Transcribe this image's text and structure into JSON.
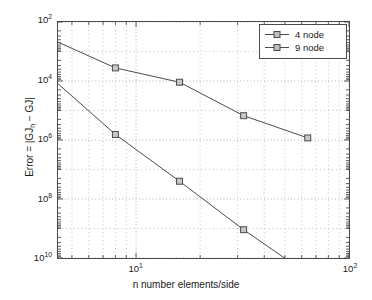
{
  "chart_data": {
    "type": "line",
    "title": "",
    "xlabel": "n number elements/side",
    "ylabel": "Error = |GJ_h − GJ|",
    "ylabel_parts": {
      "prefix": "Error = |GJ",
      "sub": "h",
      "suffix": " − GJ|"
    },
    "xscale": "log",
    "yscale": "log",
    "y_reversed": true,
    "xlim": [
      4.3,
      100
    ],
    "ylim": [
      100,
      10000000000
    ],
    "grid": true,
    "grid_style": "dotted",
    "legend_position": "upper right",
    "x": [
      4,
      8,
      16,
      32,
      64
    ],
    "xticks": [
      {
        "value": 10,
        "label_mantissa": "10",
        "label_exponent": "1"
      },
      {
        "value": 100,
        "label_mantissa": "10",
        "label_exponent": "2"
      }
    ],
    "yticks": [
      {
        "value": 100,
        "label_mantissa": "10",
        "label_exponent": "2"
      },
      {
        "value": 10000,
        "label_mantissa": "10",
        "label_exponent": "4"
      },
      {
        "value": 1000000,
        "label_mantissa": "10",
        "label_exponent": "6"
      },
      {
        "value": 100000000,
        "label_mantissa": "10",
        "label_exponent": "8"
      },
      {
        "value": 10000000000,
        "label_mantissa": "10",
        "label_exponent": "10"
      }
    ],
    "series": [
      {
        "name": "4 node",
        "marker": "square",
        "color": "#4a4a4a",
        "values": [
          380,
          3600,
          11000,
          150000,
          850000
        ]
      },
      {
        "name": "9 node",
        "marker": "square",
        "color": "#4a4a4a",
        "values": [
          7800,
          650000,
          25000000,
          1100000000,
          35000000000
        ]
      }
    ]
  },
  "legend": {
    "entries": [
      {
        "label": "4 node"
      },
      {
        "label": "9 node"
      }
    ]
  },
  "axes": {
    "x_title": "n number elements/side",
    "y_title_prefix": "Error = |GJ",
    "y_title_sub": "h",
    "y_title_suffix": " − GJ|"
  }
}
